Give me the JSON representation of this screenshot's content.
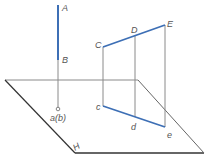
{
  "diagram": {
    "colors": {
      "blue": "#3d6fb5",
      "gray": "#8a8a8a",
      "dark": "#333333",
      "label": "#555555"
    },
    "labels": {
      "A": "A",
      "B": "B",
      "ab": "a(b)",
      "C": "C",
      "D": "D",
      "E": "E",
      "c": "c",
      "d": "d",
      "e": "e",
      "H": "H"
    }
  }
}
